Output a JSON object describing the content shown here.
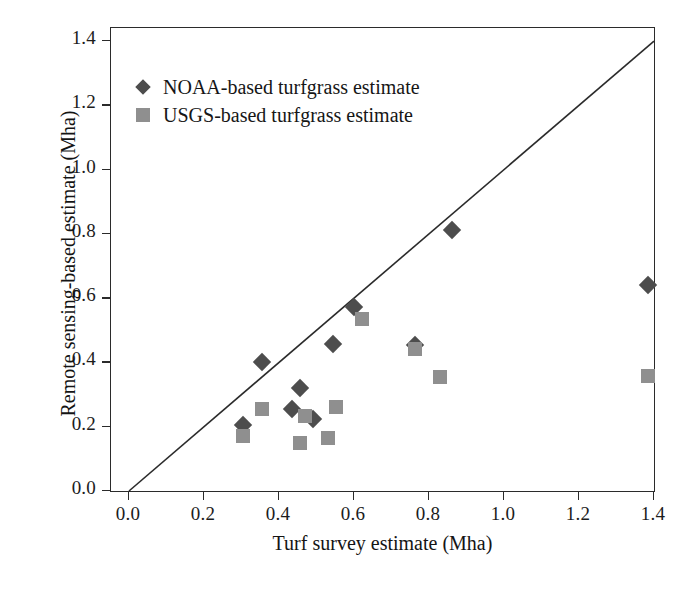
{
  "chart_data": {
    "type": "scatter",
    "title": "",
    "xlabel": "Turf survey estimate (Mha)",
    "ylabel": "Remote sensing-based estimate (Mha)",
    "xlim": [
      0.0,
      1.45
    ],
    "ylim": [
      0.0,
      1.45
    ],
    "xticks": [
      "0.0",
      "0.2",
      "0.4",
      "0.6",
      "0.8",
      "1.0",
      "1.2",
      "1.4"
    ],
    "yticks": [
      "0.0",
      "0.2",
      "0.4",
      "0.6",
      "0.8",
      "1.0",
      "1.2",
      "1.4"
    ],
    "grid": false,
    "legend_position": "upper-left",
    "reference_line": {
      "name": "one-to-one-line",
      "from": [
        0.0,
        0.0
      ],
      "to": [
        1.4,
        1.4
      ],
      "color": "#2b2b2b"
    },
    "series": [
      {
        "name": "NOAA-based turfgrass estimate",
        "marker": "diamond",
        "color": "#4d4d4d",
        "points": [
          [
            0.305,
            0.205
          ],
          [
            0.355,
            0.4
          ],
          [
            0.455,
            0.32
          ],
          [
            0.435,
            0.255
          ],
          [
            0.49,
            0.225
          ],
          [
            0.545,
            0.458
          ],
          [
            0.6,
            0.572
          ],
          [
            0.762,
            0.455
          ],
          [
            0.862,
            0.812
          ],
          [
            1.385,
            0.64
          ]
        ]
      },
      {
        "name": "USGS-based turfgrass estimate",
        "marker": "square",
        "color": "#8f8f8f",
        "points": [
          [
            0.305,
            0.172
          ],
          [
            0.355,
            0.255
          ],
          [
            0.455,
            0.15
          ],
          [
            0.468,
            0.232
          ],
          [
            0.53,
            0.165
          ],
          [
            0.552,
            0.262
          ],
          [
            0.62,
            0.535
          ],
          [
            0.762,
            0.442
          ],
          [
            0.83,
            0.355
          ],
          [
            1.385,
            0.358
          ]
        ]
      }
    ]
  },
  "legend": {
    "items": [
      {
        "label": "NOAA-based turfgrass estimate",
        "marker": "diamond"
      },
      {
        "label": "USGS-based turfgrass estimate",
        "marker": "square"
      }
    ]
  },
  "colors": {
    "noaa_marker": "#4d4d4d",
    "usgs_marker": "#8f8f8f",
    "axis": "#2b2b2b",
    "background": "#ffffff"
  }
}
